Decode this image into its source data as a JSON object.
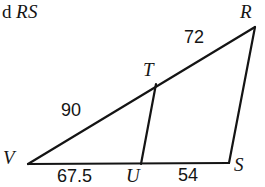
{
  "page": {
    "background_color": "#ffffff",
    "ink_color": "#141414",
    "width": 265,
    "height": 187
  },
  "stem": {
    "visible_fragment": "d",
    "segment_name": "RS"
  },
  "figure": {
    "type": "geometry-diagram",
    "stroke_color": "#141414",
    "stroke_width": 2.2,
    "vertices": [
      {
        "label": "R",
        "x": 255,
        "y": 27
      },
      {
        "label": "T",
        "x": 156,
        "y": 84
      },
      {
        "label": "V",
        "x": 28,
        "y": 164
      },
      {
        "label": "U",
        "x": 141,
        "y": 164
      },
      {
        "label": "S",
        "x": 229,
        "y": 163
      }
    ],
    "edges": [
      {
        "name": "VR",
        "from": "V",
        "to": "R"
      },
      {
        "name": "RS",
        "from": "R",
        "to": "S"
      },
      {
        "name": "VS",
        "from": "V",
        "to": "S"
      },
      {
        "name": "TU",
        "from": "T",
        "to": "U"
      }
    ],
    "measures": [
      {
        "name": "TR",
        "value": "72",
        "for_edge": "TR"
      },
      {
        "name": "VT",
        "value": "90",
        "for_edge": "VT"
      },
      {
        "name": "VU",
        "value": "67.5",
        "for_edge": "VU"
      },
      {
        "name": "US",
        "value": "54",
        "for_edge": "US"
      }
    ]
  }
}
